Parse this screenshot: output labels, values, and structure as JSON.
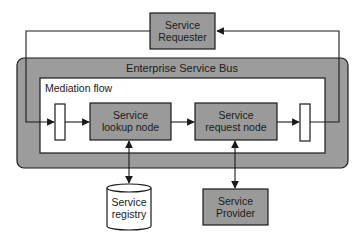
{
  "diagram": {
    "colors": {
      "box_fill": "#9a9a9a",
      "bus_fill": "#9c9c9c",
      "flow_fill": "#ffffff",
      "stroke": "#1a1a1a",
      "cylinder_fill": "#ffffff"
    },
    "nodes": {
      "service_requester": {
        "line1": "Service",
        "line2": "Requester"
      },
      "esb": {
        "label": "Enterprise Service Bus"
      },
      "mediation_flow": {
        "label": "Mediation flow"
      },
      "lookup_node": {
        "line1": "Service",
        "line2": "lookup node"
      },
      "request_node": {
        "line1": "Service",
        "line2": "request node"
      },
      "service_registry": {
        "line1": "Service",
        "line2": "registry"
      },
      "service_provider": {
        "line1": "Service",
        "line2": "Provider"
      }
    },
    "edges": [
      {
        "from": "service_requester",
        "to": "input_terminal"
      },
      {
        "from": "input_terminal",
        "to": "lookup_node"
      },
      {
        "from": "lookup_node",
        "to": "request_node"
      },
      {
        "from": "request_node",
        "to": "output_terminal"
      },
      {
        "from": "output_terminal",
        "to": "service_requester"
      },
      {
        "from": "lookup_node",
        "to": "service_registry",
        "bidirectional": true
      },
      {
        "from": "request_node",
        "to": "service_provider",
        "bidirectional": true
      }
    ]
  }
}
